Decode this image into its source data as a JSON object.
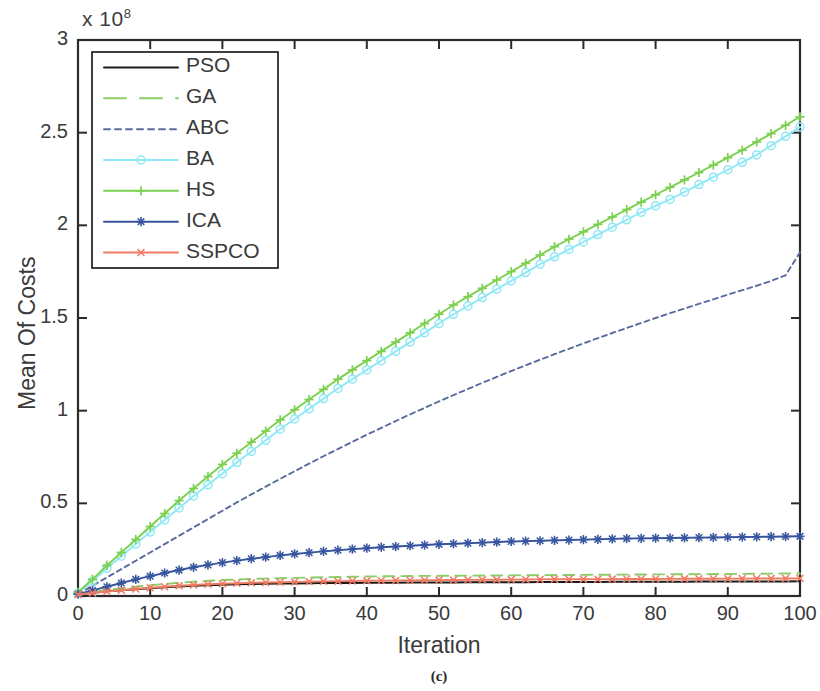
{
  "figure": {
    "caption": "(c)",
    "exponent_prefix": "x 10",
    "exponent_value": "8"
  },
  "chart_data": {
    "type": "line",
    "title": "",
    "subtitle": "",
    "xlabel": "Iteration",
    "ylabel": "Mean Of Costs",
    "y_exponent_label": "x 10^8",
    "y_scale_factor": 100000000,
    "xlim": [
      0,
      100
    ],
    "ylim": [
      0,
      3
    ],
    "xticks": [
      0,
      10,
      20,
      30,
      40,
      50,
      60,
      70,
      80,
      90,
      100
    ],
    "xticklabels": [
      "0",
      "10",
      "20",
      "30",
      "40",
      "50",
      "60",
      "70",
      "80",
      "90",
      "100"
    ],
    "yticks": [
      0,
      0.5,
      1,
      1.5,
      2,
      2.5,
      3
    ],
    "yticklabels": [
      "0",
      "0.5",
      "1",
      "1.5",
      "2",
      "2.5",
      "3"
    ],
    "grid": false,
    "legend_position": "upper left",
    "x": [
      0,
      2,
      4,
      6,
      8,
      10,
      12,
      14,
      16,
      18,
      20,
      22,
      24,
      26,
      28,
      30,
      32,
      34,
      36,
      38,
      40,
      42,
      44,
      46,
      48,
      50,
      52,
      54,
      56,
      58,
      60,
      62,
      64,
      66,
      68,
      70,
      72,
      74,
      76,
      78,
      80,
      82,
      84,
      86,
      88,
      90,
      92,
      94,
      96,
      98,
      100
    ],
    "series": [
      {
        "name": "PSO",
        "color": "#1a1a1a",
        "linestyle": "solid",
        "marker": "none",
        "values": [
          0.01,
          0.018,
          0.025,
          0.031,
          0.037,
          0.042,
          0.047,
          0.051,
          0.055,
          0.058,
          0.061,
          0.063,
          0.065,
          0.066,
          0.067,
          0.068,
          0.069,
          0.0695,
          0.07,
          0.0705,
          0.071,
          0.0715,
          0.072,
          0.0723,
          0.0726,
          0.073,
          0.0733,
          0.0736,
          0.0739,
          0.0742,
          0.0745,
          0.0748,
          0.0751,
          0.0754,
          0.0757,
          0.076,
          0.0762,
          0.0764,
          0.0766,
          0.0768,
          0.077,
          0.0772,
          0.0774,
          0.0776,
          0.0778,
          0.078,
          0.0782,
          0.0784,
          0.0786,
          0.0788,
          0.079
        ]
      },
      {
        "name": "GA",
        "color": "#8ace6a",
        "linestyle": "dashed",
        "marker": "none",
        "values": [
          0.012,
          0.022,
          0.032,
          0.041,
          0.05,
          0.058,
          0.065,
          0.071,
          0.077,
          0.082,
          0.086,
          0.089,
          0.092,
          0.094,
          0.096,
          0.098,
          0.0995,
          0.101,
          0.1025,
          0.104,
          0.105,
          0.106,
          0.107,
          0.108,
          0.1085,
          0.109,
          0.1095,
          0.11,
          0.1105,
          0.111,
          0.1115,
          0.112,
          0.1125,
          0.113,
          0.1135,
          0.114,
          0.1145,
          0.115,
          0.1155,
          0.116,
          0.1165,
          0.117,
          0.1175,
          0.118,
          0.1185,
          0.119,
          0.1195,
          0.12,
          0.1205,
          0.121,
          0.1215
        ]
      },
      {
        "name": "ABC",
        "color": "#5a6b9e",
        "linestyle": "dotted",
        "marker": "none",
        "values": [
          0.01,
          0.055,
          0.1,
          0.145,
          0.19,
          0.235,
          0.28,
          0.325,
          0.37,
          0.415,
          0.46,
          0.505,
          0.548,
          0.59,
          0.632,
          0.673,
          0.714,
          0.754,
          0.793,
          0.832,
          0.87,
          0.907,
          0.944,
          0.98,
          1.015,
          1.05,
          1.084,
          1.117,
          1.15,
          1.182,
          1.214,
          1.245,
          1.275,
          1.305,
          1.334,
          1.363,
          1.391,
          1.419,
          1.446,
          1.473,
          1.5,
          1.526,
          1.551,
          1.576,
          1.601,
          1.626,
          1.65,
          1.674,
          1.7,
          1.73,
          1.855
        ]
      },
      {
        "name": "BA",
        "color": "#8fe8f5",
        "linestyle": "solid",
        "marker": "circle",
        "values": [
          0.015,
          0.08,
          0.15,
          0.215,
          0.28,
          0.345,
          0.41,
          0.475,
          0.54,
          0.6,
          0.66,
          0.72,
          0.78,
          0.84,
          0.9,
          0.955,
          1.01,
          1.065,
          1.12,
          1.17,
          1.22,
          1.27,
          1.32,
          1.37,
          1.42,
          1.47,
          1.52,
          1.565,
          1.61,
          1.655,
          1.7,
          1.745,
          1.79,
          1.83,
          1.87,
          1.91,
          1.95,
          1.99,
          2.03,
          2.07,
          2.105,
          2.14,
          2.18,
          2.22,
          2.26,
          2.3,
          2.34,
          2.38,
          2.43,
          2.48,
          2.53
        ]
      },
      {
        "name": "HS",
        "color": "#7bd14f",
        "linestyle": "solid",
        "marker": "plus",
        "values": [
          0.02,
          0.09,
          0.165,
          0.235,
          0.305,
          0.375,
          0.445,
          0.515,
          0.58,
          0.645,
          0.71,
          0.77,
          0.83,
          0.89,
          0.95,
          1.005,
          1.06,
          1.115,
          1.17,
          1.22,
          1.27,
          1.32,
          1.37,
          1.42,
          1.47,
          1.52,
          1.57,
          1.615,
          1.66,
          1.705,
          1.75,
          1.795,
          1.84,
          1.885,
          1.925,
          1.965,
          2.005,
          2.045,
          2.085,
          2.125,
          2.165,
          2.205,
          2.245,
          2.285,
          2.325,
          2.365,
          2.405,
          2.45,
          2.495,
          2.54,
          2.585
        ]
      },
      {
        "name": "ICA",
        "color": "#36559e",
        "linestyle": "solid",
        "marker": "asterisk",
        "values": [
          0.01,
          0.03,
          0.05,
          0.07,
          0.09,
          0.107,
          0.124,
          0.14,
          0.155,
          0.168,
          0.18,
          0.191,
          0.201,
          0.21,
          0.219,
          0.227,
          0.234,
          0.241,
          0.247,
          0.253,
          0.258,
          0.263,
          0.267,
          0.271,
          0.275,
          0.279,
          0.282,
          0.285,
          0.288,
          0.291,
          0.294,
          0.296,
          0.298,
          0.3,
          0.302,
          0.304,
          0.306,
          0.308,
          0.31,
          0.311,
          0.312,
          0.313,
          0.314,
          0.315,
          0.316,
          0.317,
          0.318,
          0.319,
          0.32,
          0.321,
          0.322
        ]
      },
      {
        "name": "SSPCO",
        "color": "#ef7b63",
        "linestyle": "solid",
        "marker": "cross",
        "values": [
          0.008,
          0.016,
          0.024,
          0.031,
          0.038,
          0.044,
          0.05,
          0.055,
          0.059,
          0.063,
          0.066,
          0.069,
          0.071,
          0.073,
          0.0745,
          0.076,
          0.0775,
          0.079,
          0.08,
          0.081,
          0.082,
          0.083,
          0.0838,
          0.0845,
          0.0852,
          0.0858,
          0.0864,
          0.087,
          0.0875,
          0.088,
          0.0885,
          0.089,
          0.0895,
          0.09,
          0.0903,
          0.0906,
          0.0909,
          0.0912,
          0.0915,
          0.0918,
          0.0921,
          0.0924,
          0.0927,
          0.093,
          0.0933,
          0.0936,
          0.0939,
          0.0942,
          0.0945,
          0.0948,
          0.095
        ]
      }
    ]
  },
  "legend": {
    "items": [
      {
        "label": "PSO"
      },
      {
        "label": "GA"
      },
      {
        "label": "ABC"
      },
      {
        "label": "BA"
      },
      {
        "label": "HS"
      },
      {
        "label": "ICA"
      },
      {
        "label": "SSPCO"
      }
    ]
  },
  "axes_style": {
    "axis_color": "#2b2b2b",
    "background": "#ffffff"
  }
}
